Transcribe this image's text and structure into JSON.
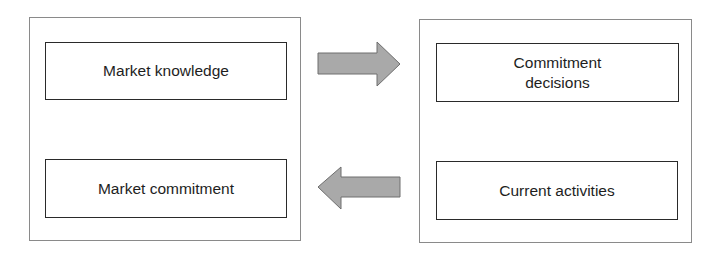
{
  "diagram": {
    "left_panel": {
      "boxes": [
        {
          "label": "Market knowledge"
        },
        {
          "label": "Market commitment"
        }
      ]
    },
    "right_panel": {
      "boxes": [
        {
          "label": "Commitment\ndecisions"
        },
        {
          "label": "Current activities"
        }
      ]
    },
    "arrows": [
      {
        "direction": "right",
        "from": "left_panel",
        "to": "right_panel"
      },
      {
        "direction": "left",
        "from": "right_panel",
        "to": "left_panel"
      }
    ],
    "colors": {
      "arrow_fill": "#a9a9a9",
      "arrow_stroke": "#6e6e6e",
      "box_border": "#2a2a2a",
      "panel_border": "#8a8a8a"
    }
  }
}
